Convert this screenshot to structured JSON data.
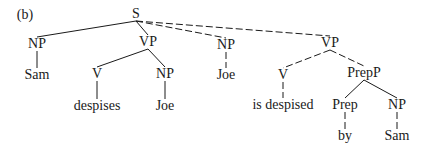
{
  "panel_label": "(b)",
  "colors": {
    "ink": "#1a1a1a",
    "background": "#ffffff"
  },
  "nodes": [
    {
      "id": "S",
      "label": "S",
      "x": 136,
      "y": 14
    },
    {
      "id": "NP1",
      "label": "NP",
      "x": 37,
      "y": 44
    },
    {
      "id": "Sam1",
      "label": "Sam",
      "x": 37,
      "y": 75
    },
    {
      "id": "VP1",
      "label": "VP",
      "x": 148,
      "y": 42
    },
    {
      "id": "V1",
      "label": "V",
      "x": 97,
      "y": 74
    },
    {
      "id": "NP2",
      "label": "NP",
      "x": 165,
      "y": 74
    },
    {
      "id": "despises",
      "label": "despises",
      "x": 97,
      "y": 106
    },
    {
      "id": "Joe1",
      "label": "Joe",
      "x": 165,
      "y": 106
    },
    {
      "id": "NP3",
      "label": "NP",
      "x": 226,
      "y": 45
    },
    {
      "id": "Joe2",
      "label": "Joe",
      "x": 226,
      "y": 75
    },
    {
      "id": "VP2",
      "label": "VP",
      "x": 330,
      "y": 43
    },
    {
      "id": "V2",
      "label": "V",
      "x": 283,
      "y": 75
    },
    {
      "id": "PrepP",
      "label": "PrepP",
      "x": 364,
      "y": 73
    },
    {
      "id": "isdesp",
      "label": "is despised",
      "x": 283,
      "y": 105
    },
    {
      "id": "Prep",
      "label": "Prep",
      "x": 345,
      "y": 105
    },
    {
      "id": "NP4",
      "label": "NP",
      "x": 397,
      "y": 105
    },
    {
      "id": "by",
      "label": "by",
      "x": 345,
      "y": 136
    },
    {
      "id": "Sam2",
      "label": "Sam",
      "x": 397,
      "y": 136
    }
  ],
  "edges": [
    {
      "from": "S",
      "to": "NP1",
      "style": "solid"
    },
    {
      "from": "S",
      "to": "VP1",
      "style": "solid"
    },
    {
      "from": "NP1",
      "to": "Sam1",
      "style": "solid"
    },
    {
      "from": "VP1",
      "to": "V1",
      "style": "solid"
    },
    {
      "from": "VP1",
      "to": "NP2",
      "style": "solid"
    },
    {
      "from": "V1",
      "to": "despises",
      "style": "solid"
    },
    {
      "from": "NP2",
      "to": "Joe1",
      "style": "solid"
    },
    {
      "from": "S",
      "to": "NP3",
      "style": "dashed"
    },
    {
      "from": "S",
      "to": "VP2",
      "style": "dashed"
    },
    {
      "from": "NP3",
      "to": "Joe2",
      "style": "dashed"
    },
    {
      "from": "VP2",
      "to": "V2",
      "style": "dashed"
    },
    {
      "from": "VP2",
      "to": "PrepP",
      "style": "dashed"
    },
    {
      "from": "V2",
      "to": "isdesp",
      "style": "dashed"
    },
    {
      "from": "PrepP",
      "to": "Prep",
      "style": "solid"
    },
    {
      "from": "PrepP",
      "to": "NP4",
      "style": "solid"
    },
    {
      "from": "Prep",
      "to": "by",
      "style": "dashed"
    },
    {
      "from": "NP4",
      "to": "Sam2",
      "style": "dashed"
    }
  ]
}
